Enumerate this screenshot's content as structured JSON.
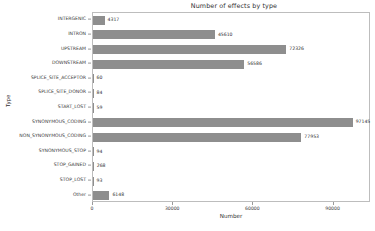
{
  "chart_data": {
    "type": "bar",
    "orientation": "horizontal",
    "title": "Number of effects by type",
    "xlabel": "Number",
    "ylabel": "Type",
    "categories": [
      "INTERGENIC",
      "INTRON",
      "UPSTREAM",
      "DOWNSTREAM",
      "SPLICE_SITE_ACCEPTOR",
      "SPLICE_SITE_DONOR",
      "START_LOST",
      "SYNONYMOUS_CODING",
      "NON_SYNONYMOUS_CODING",
      "SYNONYMOUS_STOP",
      "STOP_GAINED",
      "STOP_LOST",
      "Other"
    ],
    "values": [
      4317,
      45610,
      72326,
      56586,
      60,
      84,
      59,
      97145,
      77953,
      94,
      268,
      93,
      6148
    ],
    "value_labels": [
      "4317",
      "45610",
      "72326",
      "56586",
      "60",
      "84",
      "59",
      "97145",
      "77953",
      "94",
      "268",
      "93",
      "6148"
    ],
    "xlim": [
      0,
      104000
    ],
    "xticks": [
      0,
      30000,
      60000,
      90000
    ],
    "xtick_labels": [
      "0",
      "30000",
      "60000",
      "90000"
    ],
    "grid": false,
    "legend": "none",
    "bar_color": "#8e8e8e",
    "frame_color": "#bdbdbd",
    "text_color": "#2f2f2f"
  }
}
